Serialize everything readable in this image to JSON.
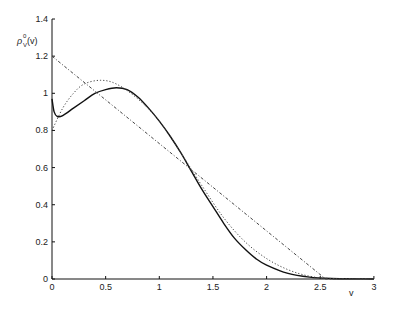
{
  "chart_data": {
    "type": "line",
    "title": "",
    "xlabel": "v",
    "ylabel": "ρ_V^0(v)",
    "xlim": [
      0,
      3
    ],
    "ylim": [
      0,
      1.4
    ],
    "grid": false,
    "legend": null,
    "x_ticks": [
      "0",
      "0.5",
      "1",
      "1.5",
      "2",
      "2.5",
      "3"
    ],
    "y_ticks": [
      "0",
      "0.2",
      "0.4",
      "0.6",
      "0.8",
      "1",
      "1.2",
      "1.4"
    ],
    "series": [
      {
        "name": "solid",
        "style": "solid",
        "x": [
          0,
          0.02,
          0.05,
          0.1,
          0.2,
          0.3,
          0.4,
          0.5,
          0.6,
          0.7,
          0.8,
          0.9,
          1.0,
          1.1,
          1.2,
          1.3,
          1.4,
          1.5,
          1.6,
          1.7,
          1.8,
          1.9,
          2.0,
          2.2,
          2.4,
          2.6,
          3.0
        ],
        "values": [
          0.97,
          0.9,
          0.875,
          0.88,
          0.92,
          0.96,
          1.0,
          1.02,
          1.03,
          1.02,
          0.98,
          0.92,
          0.85,
          0.77,
          0.68,
          0.58,
          0.48,
          0.39,
          0.3,
          0.22,
          0.16,
          0.11,
          0.075,
          0.03,
          0.01,
          0.003,
          0
        ]
      },
      {
        "name": "dotted",
        "style": "dotted",
        "x": [
          0,
          0.1,
          0.2,
          0.3,
          0.45,
          0.6,
          0.8,
          1.0,
          1.2,
          1.4,
          1.6,
          1.8,
          2.0,
          2.2,
          2.4,
          2.6,
          3.0
        ],
        "values": [
          0.8,
          0.92,
          1.0,
          1.05,
          1.07,
          1.05,
          0.97,
          0.85,
          0.68,
          0.5,
          0.33,
          0.2,
          0.11,
          0.05,
          0.015,
          0.003,
          0
        ]
      },
      {
        "name": "dash-dot",
        "style": "dashdot",
        "x": [
          0,
          2.55,
          3.0
        ],
        "values": [
          1.2,
          0,
          0
        ]
      }
    ]
  },
  "plot": {
    "origin_px": [
      52,
      279
    ],
    "px_per_x": 107.3,
    "px_per_y": 185.7,
    "line_color": "#111111"
  }
}
